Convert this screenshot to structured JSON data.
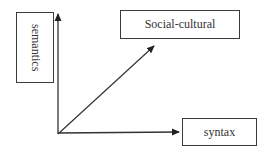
{
  "diagram": {
    "type": "three-axis concept diagram",
    "axes": [
      {
        "id": "semantics",
        "label": "semantics",
        "direction": "vertical-up"
      },
      {
        "id": "social-cultural",
        "label": "Social-cultural",
        "direction": "diagonal-up-right"
      },
      {
        "id": "syntax",
        "label": "syntax",
        "direction": "horizontal-right"
      }
    ],
    "colors": {
      "line": "#333333",
      "box_border": "#3a3a3a",
      "text": "#333333",
      "background": "#ffffff"
    }
  },
  "labels": {
    "semantics": "semantics",
    "social_cultural": "Social-cultural",
    "syntax": "syntax"
  }
}
